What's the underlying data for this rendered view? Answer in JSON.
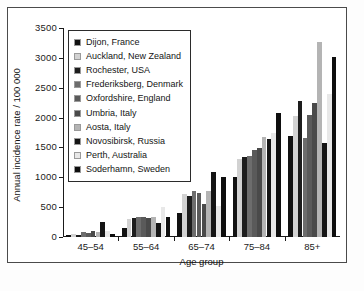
{
  "chart_data": {
    "type": "bar",
    "title": "",
    "subtitle": "",
    "xlabel": "Age group",
    "ylabel": "Annual incidence rate / 100 000",
    "categories": [
      "45–54",
      "55–64",
      "65–74",
      "75–84",
      "85+"
    ],
    "ylim": [
      0,
      3500
    ],
    "yticks": [
      0,
      500,
      1000,
      1500,
      2000,
      2500,
      3000,
      3500
    ],
    "ytick_labels": [
      "0",
      "500",
      "1000",
      "1500",
      "2000",
      "2500",
      "3000",
      "3500"
    ],
    "grid": false,
    "legend_position": "upper-left-inside",
    "series": [
      {
        "name": "Dijon, France",
        "color": "#111111",
        "values": [
          40,
          145,
          405,
          1010,
          1700
        ]
      },
      {
        "name": "Auckland, New Zealand",
        "color": "#d2d2d2",
        "values": [
          55,
          295,
          715,
          1310,
          2020
        ]
      },
      {
        "name": "Rochester, USA",
        "color": "#1d1d1d",
        "values": [
          35,
          315,
          690,
          1340,
          2275
        ]
      },
      {
        "name": "Frederiksberg, Denmark",
        "color": "#6d6d6d",
        "values": [
          85,
          340,
          770,
          1360,
          1650
        ]
      },
      {
        "name": "Oxfordshire, England",
        "color": "#5a5a5a",
        "values": [
          65,
          340,
          735,
          1455,
          2045
        ]
      },
      {
        "name": "Umbria, Italy",
        "color": "#4a4a4a",
        "values": [
          105,
          315,
          555,
          1495,
          2250
        ]
      },
      {
        "name": "Aosta, Italy",
        "color": "#b4b4b4",
        "values": [
          80,
          335,
          770,
          1670,
          3265
        ]
      },
      {
        "name": "Novosibirsk, Russia",
        "color": "#151515",
        "values": [
          255,
          230,
          1095,
          1640,
          1570
        ]
      },
      {
        "name": "Perth, Australia",
        "color": "#e8e8e8",
        "values": [
          95,
          495,
          515,
          1740,
          2395
        ]
      },
      {
        "name": "Soderhamn, Sweden",
        "color": "#0e0e0e",
        "values": [
          45,
          330,
          1000,
          2080,
          3020
        ]
      }
    ]
  }
}
